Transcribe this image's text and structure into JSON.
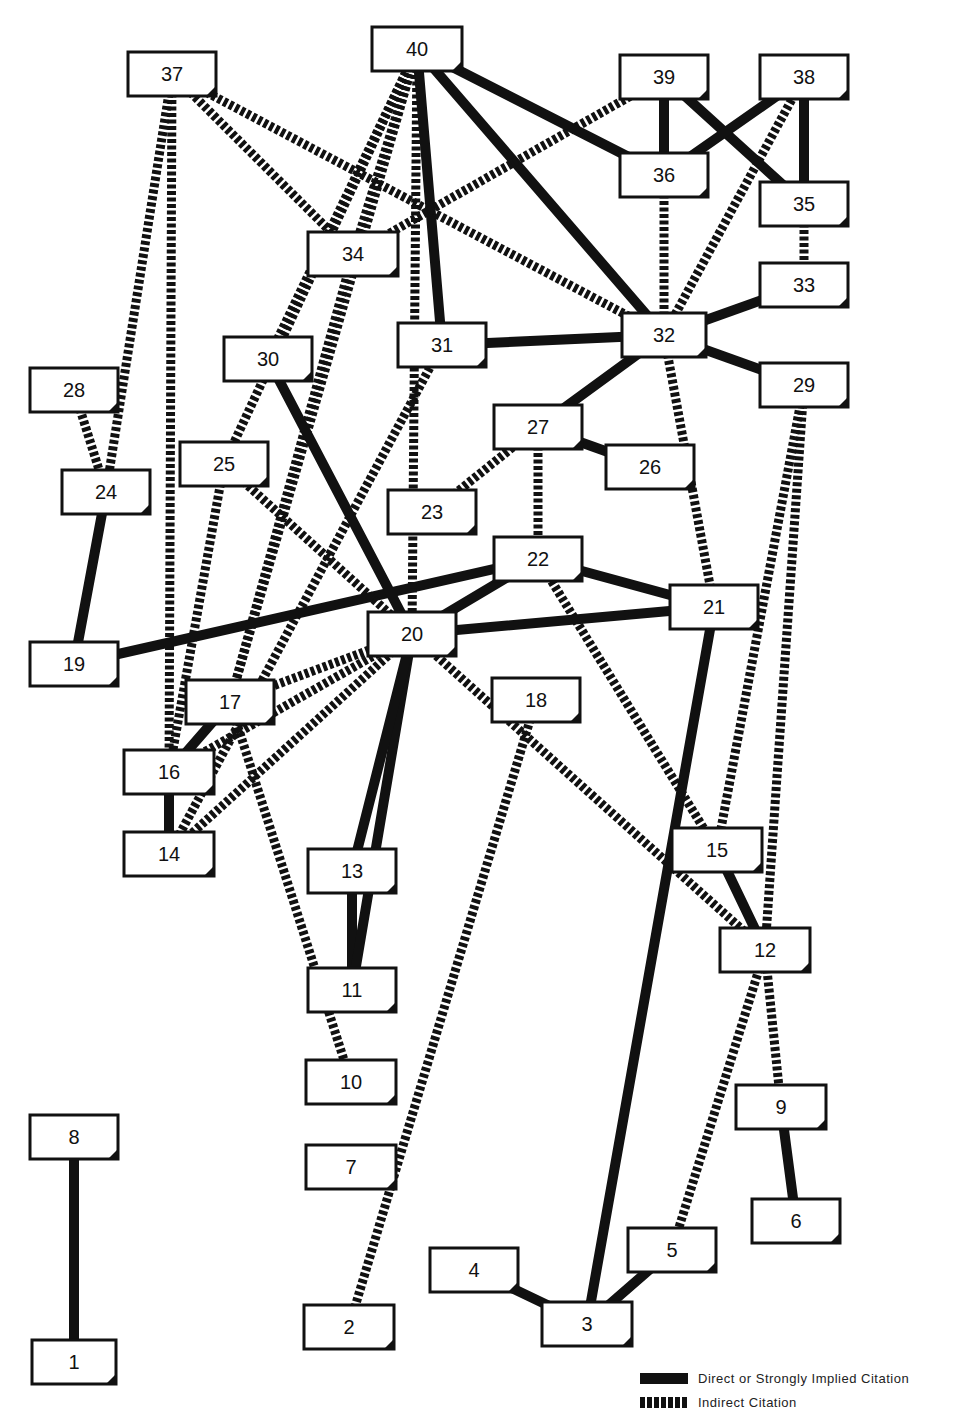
{
  "legend": {
    "direct_label": "Direct or Strongly Implied Citation",
    "indirect_label": "Indirect Citation"
  },
  "colors": {
    "ink": "#111111",
    "background": "#ffffff"
  },
  "nodes": [
    {
      "id": "1",
      "x": 32,
      "y": 1340,
      "w": 84,
      "h": 44
    },
    {
      "id": "2",
      "x": 304,
      "y": 1305,
      "w": 90,
      "h": 44
    },
    {
      "id": "3",
      "x": 542,
      "y": 1302,
      "w": 90,
      "h": 44
    },
    {
      "id": "4",
      "x": 430,
      "y": 1248,
      "w": 88,
      "h": 44
    },
    {
      "id": "5",
      "x": 628,
      "y": 1228,
      "w": 88,
      "h": 44
    },
    {
      "id": "6",
      "x": 752,
      "y": 1199,
      "w": 88,
      "h": 44
    },
    {
      "id": "7",
      "x": 306,
      "y": 1145,
      "w": 90,
      "h": 44
    },
    {
      "id": "8",
      "x": 30,
      "y": 1115,
      "w": 88,
      "h": 44
    },
    {
      "id": "9",
      "x": 736,
      "y": 1085,
      "w": 90,
      "h": 44
    },
    {
      "id": "10",
      "x": 306,
      "y": 1060,
      "w": 90,
      "h": 44
    },
    {
      "id": "11",
      "x": 308,
      "y": 968,
      "w": 88,
      "h": 44
    },
    {
      "id": "12",
      "x": 720,
      "y": 928,
      "w": 90,
      "h": 44
    },
    {
      "id": "13",
      "x": 308,
      "y": 849,
      "w": 88,
      "h": 44
    },
    {
      "id": "14",
      "x": 124,
      "y": 832,
      "w": 90,
      "h": 44
    },
    {
      "id": "15",
      "x": 672,
      "y": 828,
      "w": 90,
      "h": 44
    },
    {
      "id": "16",
      "x": 124,
      "y": 750,
      "w": 90,
      "h": 44
    },
    {
      "id": "17",
      "x": 186,
      "y": 680,
      "w": 88,
      "h": 44
    },
    {
      "id": "18",
      "x": 492,
      "y": 678,
      "w": 88,
      "h": 44
    },
    {
      "id": "19",
      "x": 30,
      "y": 642,
      "w": 88,
      "h": 44
    },
    {
      "id": "20",
      "x": 368,
      "y": 612,
      "w": 88,
      "h": 44
    },
    {
      "id": "21",
      "x": 670,
      "y": 585,
      "w": 88,
      "h": 44
    },
    {
      "id": "22",
      "x": 494,
      "y": 537,
      "w": 88,
      "h": 44
    },
    {
      "id": "23",
      "x": 388,
      "y": 490,
      "w": 88,
      "h": 44
    },
    {
      "id": "24",
      "x": 62,
      "y": 470,
      "w": 88,
      "h": 44
    },
    {
      "id": "25",
      "x": 180,
      "y": 442,
      "w": 88,
      "h": 44
    },
    {
      "id": "26",
      "x": 606,
      "y": 445,
      "w": 88,
      "h": 44
    },
    {
      "id": "27",
      "x": 494,
      "y": 405,
      "w": 88,
      "h": 44
    },
    {
      "id": "28",
      "x": 30,
      "y": 368,
      "w": 88,
      "h": 44
    },
    {
      "id": "29",
      "x": 760,
      "y": 363,
      "w": 88,
      "h": 44
    },
    {
      "id": "30",
      "x": 224,
      "y": 337,
      "w": 88,
      "h": 44
    },
    {
      "id": "31",
      "x": 398,
      "y": 323,
      "w": 88,
      "h": 44
    },
    {
      "id": "32",
      "x": 622,
      "y": 313,
      "w": 84,
      "h": 44
    },
    {
      "id": "33",
      "x": 760,
      "y": 263,
      "w": 88,
      "h": 44
    },
    {
      "id": "34",
      "x": 308,
      "y": 232,
      "w": 90,
      "h": 44
    },
    {
      "id": "35",
      "x": 760,
      "y": 182,
      "w": 88,
      "h": 44
    },
    {
      "id": "36",
      "x": 620,
      "y": 153,
      "w": 88,
      "h": 44
    },
    {
      "id": "37",
      "x": 128,
      "y": 52,
      "w": 88,
      "h": 44
    },
    {
      "id": "38",
      "x": 760,
      "y": 55,
      "w": 88,
      "h": 44
    },
    {
      "id": "39",
      "x": 620,
      "y": 55,
      "w": 88,
      "h": 44
    },
    {
      "id": "40",
      "x": 372,
      "y": 27,
      "w": 90,
      "h": 44
    }
  ],
  "edges": [
    {
      "from": "8",
      "to": "1",
      "type": "direct"
    },
    {
      "from": "18",
      "to": "2",
      "type": "indirect"
    },
    {
      "from": "21",
      "to": "3",
      "type": "direct"
    },
    {
      "from": "4",
      "to": "3",
      "type": "direct"
    },
    {
      "from": "5",
      "to": "3",
      "type": "direct"
    },
    {
      "from": "12",
      "to": "5",
      "type": "indirect"
    },
    {
      "from": "9",
      "to": "6",
      "type": "direct"
    },
    {
      "from": "12",
      "to": "9",
      "type": "indirect"
    },
    {
      "from": "17",
      "to": "10",
      "type": "indirect"
    },
    {
      "from": "13",
      "to": "11",
      "type": "direct"
    },
    {
      "from": "20",
      "to": "11",
      "type": "direct"
    },
    {
      "from": "20",
      "to": "13",
      "type": "direct"
    },
    {
      "from": "15",
      "to": "12",
      "type": "direct"
    },
    {
      "from": "20",
      "to": "12",
      "type": "indirect"
    },
    {
      "from": "29",
      "to": "12",
      "type": "indirect"
    },
    {
      "from": "22",
      "to": "15",
      "type": "indirect"
    },
    {
      "from": "29",
      "to": "15",
      "type": "indirect"
    },
    {
      "from": "16",
      "to": "14",
      "type": "direct"
    },
    {
      "from": "20",
      "to": "14",
      "type": "indirect"
    },
    {
      "from": "31",
      "to": "14",
      "type": "indirect"
    },
    {
      "from": "17",
      "to": "16",
      "type": "direct"
    },
    {
      "from": "20",
      "to": "16",
      "type": "indirect"
    },
    {
      "from": "25",
      "to": "16",
      "type": "indirect"
    },
    {
      "from": "37",
      "to": "16",
      "type": "indirect"
    },
    {
      "from": "20",
      "to": "17",
      "type": "indirect"
    },
    {
      "from": "34",
      "to": "17",
      "type": "indirect"
    },
    {
      "from": "40",
      "to": "17",
      "type": "indirect"
    },
    {
      "from": "24",
      "to": "19",
      "type": "direct"
    },
    {
      "from": "22",
      "to": "19",
      "type": "direct"
    },
    {
      "from": "22",
      "to": "20",
      "type": "direct"
    },
    {
      "from": "21",
      "to": "20",
      "type": "direct"
    },
    {
      "from": "30",
      "to": "20",
      "type": "direct"
    },
    {
      "from": "25",
      "to": "20",
      "type": "indirect"
    },
    {
      "from": "40",
      "to": "20",
      "type": "indirect"
    },
    {
      "from": "22",
      "to": "21",
      "type": "direct"
    },
    {
      "from": "32",
      "to": "21",
      "type": "indirect"
    },
    {
      "from": "27",
      "to": "22",
      "type": "indirect"
    },
    {
      "from": "27",
      "to": "23",
      "type": "indirect"
    },
    {
      "from": "28",
      "to": "24",
      "type": "indirect"
    },
    {
      "from": "37",
      "to": "24",
      "type": "indirect"
    },
    {
      "from": "40",
      "to": "25",
      "type": "indirect"
    },
    {
      "from": "27",
      "to": "26",
      "type": "direct"
    },
    {
      "from": "32",
      "to": "27",
      "type": "direct"
    },
    {
      "from": "32",
      "to": "29",
      "type": "direct"
    },
    {
      "from": "40",
      "to": "30",
      "type": "indirect"
    },
    {
      "from": "40",
      "to": "31",
      "type": "direct"
    },
    {
      "from": "32",
      "to": "31",
      "type": "direct"
    },
    {
      "from": "40",
      "to": "32",
      "type": "direct"
    },
    {
      "from": "37",
      "to": "32",
      "type": "indirect"
    },
    {
      "from": "36",
      "to": "32",
      "type": "indirect"
    },
    {
      "from": "38",
      "to": "32",
      "type": "indirect"
    },
    {
      "from": "32",
      "to": "33",
      "type": "direct"
    },
    {
      "from": "35",
      "to": "33",
      "type": "indirect"
    },
    {
      "from": "37",
      "to": "34",
      "type": "indirect"
    },
    {
      "from": "40",
      "to": "34",
      "type": "indirect"
    },
    {
      "from": "39",
      "to": "34",
      "type": "indirect"
    },
    {
      "from": "38",
      "to": "35",
      "type": "direct"
    },
    {
      "from": "39",
      "to": "35",
      "type": "direct"
    },
    {
      "from": "39",
      "to": "36",
      "type": "direct"
    },
    {
      "from": "38",
      "to": "36",
      "type": "direct"
    },
    {
      "from": "40",
      "to": "36",
      "type": "direct"
    }
  ]
}
